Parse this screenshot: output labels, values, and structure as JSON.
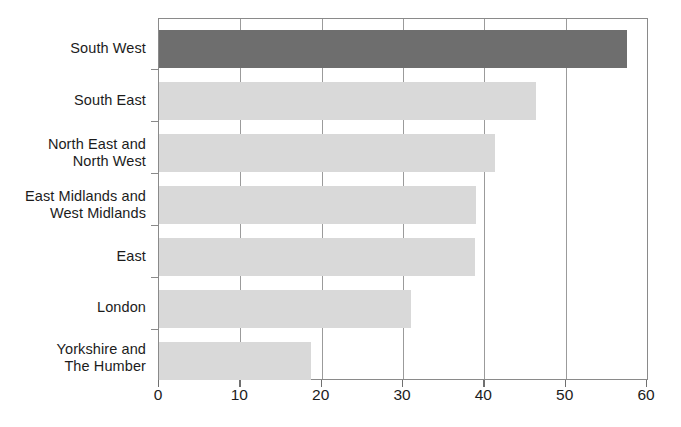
{
  "chart_data": {
    "type": "bar",
    "orientation": "horizontal",
    "title": "",
    "subtitle": "",
    "xlabel": "",
    "ylabel": "",
    "xlim": [
      0,
      60
    ],
    "ylim": null,
    "grid": true,
    "legend": null,
    "xticks": [
      "0",
      "10",
      "20",
      "30",
      "40",
      "50",
      "60"
    ],
    "xtick_values": [
      0,
      10,
      20,
      30,
      40,
      50,
      60
    ],
    "categories": [
      "South West",
      "South East",
      "North East and North West",
      "East Midlands and West Midlands",
      "East",
      "London",
      "Yorkshire and The Humber"
    ],
    "category_lines": [
      [
        "South West",
        ""
      ],
      [
        "South East",
        ""
      ],
      [
        "North East and",
        "North West"
      ],
      [
        "East Midlands and",
        "West Midlands"
      ],
      [
        "East",
        ""
      ],
      [
        "London",
        ""
      ],
      [
        "Yorkshire and",
        "The Humber"
      ]
    ],
    "values": [
      57.5,
      46.3,
      41.3,
      39.0,
      38.8,
      31.0,
      18.7
    ],
    "highlighted_category": "South West",
    "colors": {
      "bar": "#d9d9d9",
      "highlight_bar": "#6e6e6e",
      "gridline": "#9b9b9b",
      "axis": "#8a8a8a",
      "text": "#1c1c1c",
      "background": "#ffffff"
    }
  }
}
